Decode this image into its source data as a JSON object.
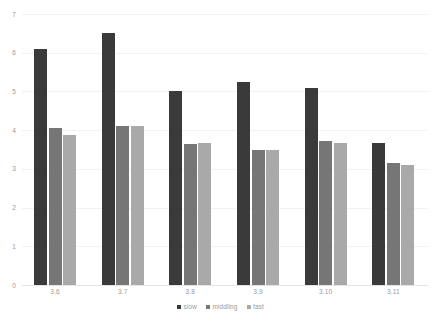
{
  "chart_data": {
    "type": "bar",
    "title": "",
    "subtitle": "",
    "xlabel": "",
    "ylabel": "",
    "ylim": [
      0,
      7
    ],
    "y_ticks": [
      "0",
      "1",
      "2",
      "3",
      "4",
      "5",
      "6",
      "7"
    ],
    "grid": true,
    "legend_position": "bottom",
    "categories": [
      "3.6",
      "3.7",
      "3.8",
      "3.9",
      "3.10",
      "3.11"
    ],
    "series": [
      {
        "name": "slow",
        "color": "#3a3a3a",
        "values": [
          6.1,
          6.5,
          5.0,
          5.25,
          5.08,
          3.68
        ]
      },
      {
        "name": "middling",
        "color": "#767676",
        "values": [
          4.05,
          4.1,
          3.65,
          3.5,
          3.72,
          3.15
        ]
      },
      {
        "name": "fast",
        "color": "#a9a9a9",
        "values": [
          3.87,
          4.1,
          3.67,
          3.48,
          3.68,
          3.1
        ]
      }
    ]
  },
  "colors": {
    "background": "#ffffff",
    "gridline": "#f2f2f2",
    "baseline": "#e4e4e4",
    "tick_text": "#9a9a9a"
  }
}
